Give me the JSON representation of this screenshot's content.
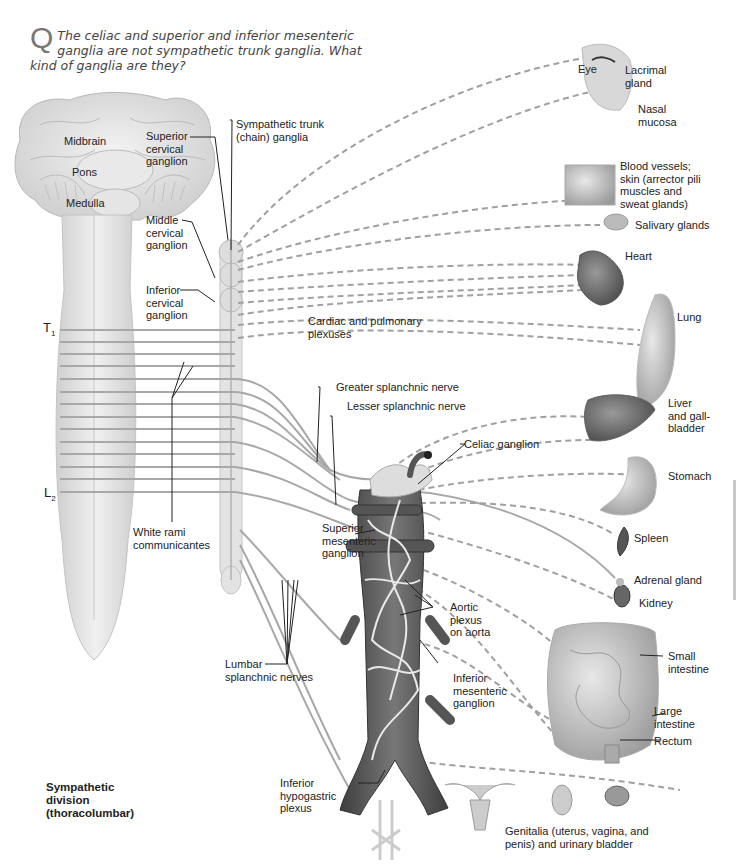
{
  "question": {
    "marker": "Q",
    "text": "The celiac and superior and inferior mesenteric ganglia are not sympathetic trunk ganglia. What kind of ganglia are they?"
  },
  "figure_title": {
    "line1": "Sympathetic",
    "line2": "division",
    "line3": "(thoracolumbar)"
  },
  "cns_labels": {
    "midbrain": "Midbrain",
    "pons": "Pons",
    "medulla": "Medulla",
    "t1_main": "T",
    "t1_sub": "1",
    "l2_main": "L",
    "l2_sub": "2"
  },
  "ganglia_labels": {
    "sympathetic_trunk_1": "Sympathetic trunk",
    "sympathetic_trunk_2": "(chain) ganglia",
    "superior_cervical_1": "Superior",
    "superior_cervical_2": "cervical",
    "superior_cervical_3": "ganglion",
    "middle_cervical_1": "Middle",
    "middle_cervical_2": "cervical",
    "middle_cervical_3": "ganglion",
    "inferior_cervical_1": "Inferior",
    "inferior_cervical_2": "cervical",
    "inferior_cervical_3": "ganglion",
    "white_rami_1": "White rami",
    "white_rami_2": "communicantes",
    "cardiac_pulmonary_1": "Cardiac and pulmonary",
    "cardiac_pulmonary_2": "plexuses",
    "greater_splanchnic": "Greater splanchnic nerve",
    "lesser_splanchnic": "Lesser splanchnic nerve",
    "celiac": "Celiac ganglion",
    "superior_mesenteric_1": "Superior",
    "superior_mesenteric_2": "mesenteric",
    "superior_mesenteric_3": "ganglion",
    "aortic_plexus_1": "Aortic",
    "aortic_plexus_2": "plexus",
    "aortic_plexus_3": "on aorta",
    "inferior_mesenteric_1": "Inferior",
    "inferior_mesenteric_2": "mesenteric",
    "inferior_mesenteric_3": "ganglion",
    "lumbar_splanchnic_1": "Lumbar",
    "lumbar_splanchnic_2": "splanchnic nerves",
    "inferior_hypogastric_1": "Inferior",
    "inferior_hypogastric_2": "hypogastric",
    "inferior_hypogastric_3": "plexus"
  },
  "organ_labels": {
    "eye": "Eye",
    "lacrimal_1": "Lacrimal",
    "lacrimal_2": "gland",
    "nasal_1": "Nasal",
    "nasal_2": "mucosa",
    "blood_vessels_1": "Blood vessels;",
    "blood_vessels_2": "skin (arrector pili",
    "blood_vessels_3": "muscles and",
    "blood_vessels_4": "sweat glands)",
    "salivary": "Salivary glands",
    "heart": "Heart",
    "lung": "Lung",
    "liver_1": "Liver",
    "liver_2": "and gall-",
    "liver_3": "bladder",
    "stomach": "Stomach",
    "spleen": "Spleen",
    "adrenal": "Adrenal gland",
    "kidney": "Kidney",
    "small_intestine_1": "Small",
    "small_intestine_2": "intestine",
    "large_intestine_1": "Large",
    "large_intestine_2": "intestine",
    "rectum": "Rectum",
    "genitalia_1": "Genitalia (uterus, vagina, and",
    "genitalia_2": "penis) and urinary bladder"
  },
  "colors": {
    "nerve_gray": "#a8a8a8",
    "leader_line": "#222222",
    "cord_fill": "#e6e6e6",
    "aorta_fill": "#5e5e5e",
    "question_text": "#444444"
  }
}
